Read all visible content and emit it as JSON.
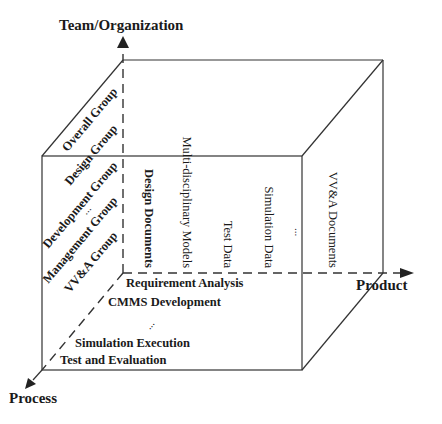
{
  "diagram": {
    "type": "3d-cube-framework",
    "axes": {
      "team": {
        "label": "Team/Organization",
        "direction": "up"
      },
      "product": {
        "label": "Product",
        "direction": "right"
      },
      "process": {
        "label": "Process",
        "direction": "down-left"
      }
    },
    "team_groups": [
      {
        "label": "Overall Group"
      },
      {
        "label": "Design Group"
      },
      {
        "label": "Development Group"
      },
      {
        "label": "..."
      },
      {
        "label": "Management Group"
      },
      {
        "label": "VV&A Group"
      }
    ],
    "products": [
      {
        "label": "Design Documents"
      },
      {
        "label": "Multi-disciplinary Models"
      },
      {
        "label": "Test Data"
      },
      {
        "label": "Simulation Data"
      },
      {
        "label": "..."
      },
      {
        "label": "VV&A Documents"
      }
    ],
    "processes": [
      {
        "label": "Requirement Analysis"
      },
      {
        "label": "CMMS Development"
      },
      {
        "label": "..."
      },
      {
        "label": "Simulation Execution"
      },
      {
        "label": "Test and Evaluation"
      }
    ],
    "colors": {
      "line": "#333333",
      "text": "#1a1a1a",
      "background": "#ffffff"
    }
  }
}
